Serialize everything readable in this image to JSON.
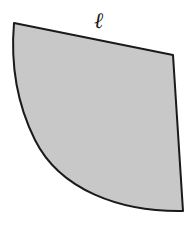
{
  "diagram": {
    "type": "geometric-figure",
    "shape": {
      "fill_color": "#c8c8c8",
      "stroke_color": "#1a1a1a",
      "vertices": {
        "top_left": [
          14,
          23
        ],
        "top_right": [
          173,
          55
        ],
        "bottom_right": [
          183,
          211
        ]
      }
    },
    "labels": {
      "top_edge": "ℓ"
    }
  }
}
